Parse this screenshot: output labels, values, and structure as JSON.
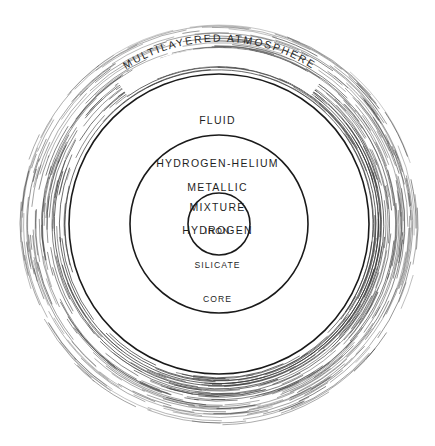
{
  "figure": {
    "background_color": "#ffffff",
    "line_color": "#1a1a1a",
    "atmosphere_stroke_color": "#3a3a3a",
    "text_color": "#1f1f1f",
    "width": 435,
    "height": 446
  },
  "chart_data": {
    "type": "diagram",
    "subtype": "concentric-cross-section",
    "title": "",
    "center": {
      "x": 219,
      "y": 224
    },
    "layers": [
      {
        "name": "multilayered-atmosphere",
        "label": "MULTILAYERED ATMOSPHERE",
        "label_style": "curved-along-arc",
        "render": "broken concentric hatch arcs",
        "inner_radius": 152,
        "outer_radius": 201
      },
      {
        "name": "fluid-hydrogen-helium-mixture",
        "label_lines": [
          "FLUID",
          "HYDROGEN-HELIUM",
          "MIXTURE"
        ],
        "render": "solid circle outline",
        "radius": 150
      },
      {
        "name": "metallic-hydrogen",
        "label_lines": [
          "METALLIC",
          "HYDROGEN"
        ],
        "render": "solid circle outline",
        "radius": 89
      },
      {
        "name": "iron-silicate-core",
        "label_lines": [
          "IRON",
          "SILICATE",
          "CORE"
        ],
        "render": "solid circle outline",
        "radius": 31
      }
    ]
  },
  "labels": {
    "atmosphere": "MULTILAYERED ATMOSPHERE",
    "fluid_line1": "FLUID",
    "fluid_line2": "HYDROGEN-HELIUM",
    "fluid_line3": "MIXTURE",
    "metallic_line1": "METALLIC",
    "metallic_line2": "HYDROGEN",
    "core_line1": "IRON",
    "core_line2": "SILICATE",
    "core_line3": "CORE"
  }
}
